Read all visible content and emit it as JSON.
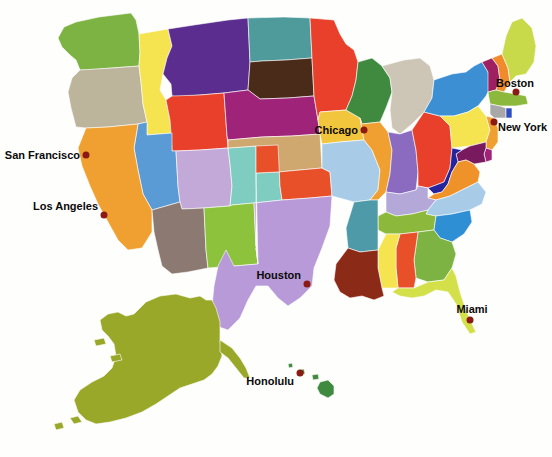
{
  "map": {
    "title": "United States map with colored states",
    "background_color": "#fefefd",
    "border_color": "#ffffff",
    "projection_note": "Continental US with Alaska and Hawaii insets"
  },
  "cities": [
    {
      "name": "San Francisco",
      "x": 86,
      "y": 155,
      "label_x": 80,
      "label_y": 155,
      "label_side": "left-of",
      "dot_color": "#8c1a14"
    },
    {
      "name": "Los Angeles",
      "x": 104,
      "y": 215,
      "label_x": 98,
      "label_y": 206,
      "label_side": "left-of",
      "dot_color": "#8c1a14"
    },
    {
      "name": "Chicago",
      "x": 364,
      "y": 130,
      "label_x": 358,
      "label_y": 130,
      "label_side": "left-of",
      "dot_color": "#8c1a14"
    },
    {
      "name": "Houston",
      "x": 307,
      "y": 284,
      "label_x": 301,
      "label_y": 275,
      "label_side": "left-of",
      "dot_color": "#8c1a14"
    },
    {
      "name": "Boston",
      "x": 516,
      "y": 92,
      "label_x": 522,
      "label_y": 83,
      "label_side": "right-of",
      "dot_color": "#8c1a14"
    },
    {
      "name": "New York",
      "x": 494,
      "y": 122,
      "label_x": 500,
      "label_y": 127,
      "label_side": "right-of",
      "dot_color": "#8c1a14"
    },
    {
      "name": "Miami",
      "x": 470,
      "y": 320,
      "label_x": 470,
      "label_y": 308,
      "label_side": "above",
      "dot_color": "#8c1a14"
    },
    {
      "name": "Honolulu",
      "x": 300,
      "y": 373,
      "label_x": 294,
      "label_y": 381,
      "label_side": "left-of",
      "dot_color": "#8c1a14"
    }
  ],
  "states": [
    {
      "code": "WA",
      "name": "Washington",
      "color": "#7cb342"
    },
    {
      "code": "OR",
      "name": "Oregon",
      "color": "#bdb49c"
    },
    {
      "code": "ID",
      "name": "Idaho",
      "color": "#f5e34f"
    },
    {
      "code": "MT",
      "name": "Montana",
      "color": "#5b2d8e"
    },
    {
      "code": "WY",
      "name": "Wyoming",
      "color": "#e8402a"
    },
    {
      "code": "ND",
      "name": "North Dakota",
      "color": "#4f9a9a"
    },
    {
      "code": "SD",
      "name": "South Dakota",
      "color": "#4a2a18"
    },
    {
      "code": "MN",
      "name": "Minnesota",
      "color": "#e8402a"
    },
    {
      "code": "WI",
      "name": "Wisconsin",
      "color": "#3f8a3f"
    },
    {
      "code": "MI",
      "name": "Michigan",
      "color": "#cdc6b6"
    },
    {
      "code": "NV",
      "name": "Nevada",
      "color": "#5b9bd5"
    },
    {
      "code": "UT",
      "name": "Utah",
      "color": "#c3a9d8"
    },
    {
      "code": "CO",
      "name": "Colorado",
      "color": "#7fccc0"
    },
    {
      "code": "NE",
      "name": "Nebraska",
      "color": "#a0237a"
    },
    {
      "code": "IA",
      "name": "Iowa",
      "color": "#f2c63c"
    },
    {
      "code": "IL",
      "name": "Illinois",
      "color": "#f0a030"
    },
    {
      "code": "IN",
      "name": "Indiana",
      "color": "#8a6bbf"
    },
    {
      "code": "OH",
      "name": "Ohio",
      "color": "#e8402a"
    },
    {
      "code": "PA",
      "name": "Pennsylvania",
      "color": "#f5e34f"
    },
    {
      "code": "NY",
      "name": "New York",
      "color": "#3d8fd4"
    },
    {
      "code": "VT",
      "name": "Vermont",
      "color": "#9e2060"
    },
    {
      "code": "NH",
      "name": "New Hampshire",
      "color": "#f08a2a"
    },
    {
      "code": "ME",
      "name": "Maine",
      "color": "#c8d94a"
    },
    {
      "code": "MA",
      "name": "Massachusetts",
      "color": "#8cb83c"
    },
    {
      "code": "CT",
      "name": "Connecticut",
      "color": "#a8a8a8"
    },
    {
      "code": "RI",
      "name": "Rhode Island",
      "color": "#2f4fc0"
    },
    {
      "code": "NJ",
      "name": "New Jersey",
      "color": "#f0a030"
    },
    {
      "code": "DE",
      "name": "Delaware",
      "color": "#a0237a"
    },
    {
      "code": "MD",
      "name": "Maryland",
      "color": "#7a1a5e"
    },
    {
      "code": "WV",
      "name": "West Virginia",
      "color": "#26249c"
    },
    {
      "code": "VA",
      "name": "Virginia",
      "color": "#f0922a"
    },
    {
      "code": "KY",
      "name": "Kentucky",
      "color": "#b3a8d8"
    },
    {
      "code": "TN",
      "name": "Tennessee",
      "color": "#8cb83c"
    },
    {
      "code": "NC",
      "name": "North Carolina",
      "color": "#a8cce8"
    },
    {
      "code": "SC",
      "name": "South Carolina",
      "color": "#2f8fd4"
    },
    {
      "code": "GA",
      "name": "Georgia",
      "color": "#7cb342"
    },
    {
      "code": "FL",
      "name": "Florida",
      "color": "#d4e04a"
    },
    {
      "code": "AL",
      "name": "Alabama",
      "color": "#e8502a"
    },
    {
      "code": "MS",
      "name": "Mississippi",
      "color": "#f5e34f"
    },
    {
      "code": "LA",
      "name": "Louisiana",
      "color": "#8c2a18"
    },
    {
      "code": "AR",
      "name": "Arkansas",
      "color": "#4f9aa8"
    },
    {
      "code": "MO",
      "name": "Missouri",
      "color": "#a8cce8"
    },
    {
      "code": "KS",
      "name": "Kansas",
      "color": "#cfa870"
    },
    {
      "code": "OK",
      "name": "Oklahoma",
      "color": "#e8502a"
    },
    {
      "code": "TX",
      "name": "Texas",
      "color": "#b89ad8"
    },
    {
      "code": "NM",
      "name": "New Mexico",
      "color": "#8cc23c"
    },
    {
      "code": "AZ",
      "name": "Arizona",
      "color": "#8c7a72"
    },
    {
      "code": "CA",
      "name": "California",
      "color": "#f0a030"
    },
    {
      "code": "AK",
      "name": "Alaska",
      "color": "#9aa82a"
    },
    {
      "code": "HI",
      "name": "Hawaii",
      "color": "#3f8a3f"
    }
  ]
}
